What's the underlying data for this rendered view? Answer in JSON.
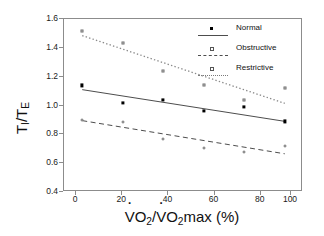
{
  "chart_data": {
    "type": "scatter",
    "title": "",
    "xlabel": "VO2/VO2max (%)",
    "ylabel": "TI/TE",
    "xlim": [
      -9,
      109
    ],
    "ylim": [
      0.4,
      1.6
    ],
    "xticks": [
      0,
      20,
      40,
      60,
      80,
      100
    ],
    "yticks": [
      "1.6",
      "1.4",
      "1.2",
      "1.0",
      "0.8",
      "0.6",
      "0.4"
    ],
    "grid": false,
    "legend_position": "top-right",
    "x": [
      0,
      20,
      40,
      60,
      80,
      100
    ],
    "series": [
      {
        "name": "Normal",
        "marker": "filled-square",
        "linestyle": "solid",
        "values": [
          1.14,
          1.02,
          1.04,
          0.96,
          0.99,
          0.89
        ],
        "fit": {
          "intercept": 1.11,
          "slope": -0.0022
        }
      },
      {
        "name": "Obstructive",
        "marker": "open-circle",
        "linestyle": "dashed",
        "values": [
          0.9,
          0.885,
          0.77,
          0.705,
          0.68,
          0.72
        ],
        "fit": {
          "intercept": 0.895,
          "slope": -0.0023
        }
      },
      {
        "name": "Restrictive",
        "marker": "open-square",
        "linestyle": "dotted",
        "values": [
          1.52,
          1.435,
          1.24,
          1.14,
          1.035,
          1.12
        ],
        "fit": {
          "intercept": 1.485,
          "slope": -0.0047
        }
      }
    ]
  },
  "axes": {
    "ylabel_main": "T",
    "ylabel_sub1": "I",
    "ylabel_div": "/T",
    "ylabel_sub2": "E",
    "xlabel_v1": "V",
    "xlabel_o1": "O",
    "xlabel_two1": "2",
    "xlabel_slash": "/",
    "xlabel_v2": "V",
    "xlabel_o2": "O",
    "xlabel_two2": "2",
    "xlabel_max": "max (%)"
  },
  "legend": {
    "items": [
      {
        "label": "Normal"
      },
      {
        "label": "Obstructive"
      },
      {
        "label": "Restrictive"
      }
    ]
  }
}
